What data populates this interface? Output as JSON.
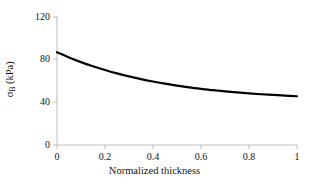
{
  "chart_data": {
    "type": "line",
    "title": "",
    "xlabel": "Normalized thickness",
    "ylabel": "σB (kPa)",
    "ylabel_symbol": "σ",
    "ylabel_subscript": "B",
    "ylabel_units": "(kPa)",
    "xlim": [
      0,
      1
    ],
    "ylim": [
      0,
      120
    ],
    "xticks": [
      0,
      0.2,
      0.4,
      0.6,
      0.8,
      1
    ],
    "xtick_labels": [
      "0",
      "0.2",
      "0.4",
      "0.6",
      "0.8",
      "1"
    ],
    "yticks": [
      0,
      40,
      80,
      120
    ],
    "ytick_labels": [
      "0",
      "40",
      "80",
      "120"
    ],
    "grid": false,
    "legend": null,
    "series": [
      {
        "name": "sigma_B",
        "color": "#000000",
        "line_width": 2.2,
        "x": [
          0,
          0.05,
          0.1,
          0.15,
          0.2,
          0.25,
          0.3,
          0.35,
          0.4,
          0.45,
          0.5,
          0.55,
          0.6,
          0.65,
          0.7,
          0.75,
          0.8,
          0.85,
          0.9,
          0.95,
          1
        ],
        "values": [
          87,
          82.1,
          77.7,
          73.8,
          70.3,
          67.1,
          64.3,
          61.8,
          59.5,
          57.5,
          55.7,
          54.1,
          52.7,
          51.4,
          50.3,
          49.3,
          48.4,
          47.6,
          46.9,
          46.3,
          45.7
        ]
      }
    ],
    "axis_color": "#b4b4b4",
    "text_color": "#141414",
    "background": "#ffffff"
  }
}
